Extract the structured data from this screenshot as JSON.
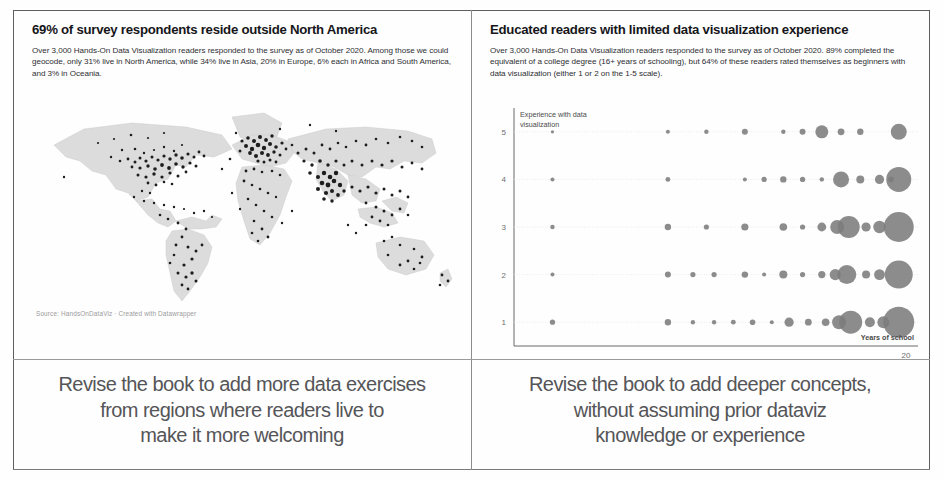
{
  "left_panel": {
    "title": "69% of survey respondents reside outside North America",
    "subtitle": "Over 3,000 Hands-On Data Visualization readers responded to the survey as of October 2020. Among those we could geocode, only 31% live in North America, while 34% live in Asia, 20% in Europe, 6% each in Africa and South America, and 3% in Oceania.",
    "source": "Source: HandsOnDataViz · Created with Datawrapper",
    "caption_lines": [
      "Revise the book to add more data exercises",
      "from regions where readers live to",
      "make it more welcoming"
    ]
  },
  "right_panel": {
    "title": "Educated readers with limited data visualization experience",
    "subtitle": "Over 3,000 Hands-On Data Visualization readers responded to the survey as of October 2020. 89% completed the equivalent of a college degree (16+ years of schooling), but 64% of these readers rated themselves as beginners with data visualization (either 1 or 2 on the 1-5 scale).",
    "caption_lines": [
      "Revise the book to add deeper concepts,",
      "without assuming prior dataviz",
      "knowledge or experience"
    ]
  },
  "colors": {
    "bubble": "#7c7c7c",
    "map_land": "#dcdcdc",
    "map_dot": "#1d1d1d",
    "text": "#1a1a1a",
    "caption": "#555558",
    "gridline": "#e2e2e2"
  },
  "chart_data": [
    {
      "type": "scatter",
      "title": "69% of survey respondents reside outside North America",
      "subtitle": "Over 3,000 Hands-On Data Visualization readers responded to the survey as of October 2020. Among those we could geocode, only 31% live in North America, while 34% live in Asia, 20% in Europe, 6% each in Africa and South America, and 3% in Oceania.",
      "xlabel": "",
      "ylabel": "",
      "legend": [],
      "grid": false,
      "description": "World symbol map of geocoded reader locations plotted as black dots over a light grey land basemap.",
      "regions": [
        {
          "name": "North America",
          "share_pct": 31
        },
        {
          "name": "Asia",
          "share_pct": 34
        },
        {
          "name": "Europe",
          "share_pct": 20
        },
        {
          "name": "Africa",
          "share_pct": 6
        },
        {
          "name": "South America",
          "share_pct": 6
        },
        {
          "name": "Oceania",
          "share_pct": 3
        }
      ],
      "total_respondents": "3,000+",
      "outside_north_america_pct": 69
    },
    {
      "type": "scatter",
      "title": "Educated readers with limited data visualization experience",
      "subtitle": "Over 3,000 Hands-On Data Visualization readers responded to the survey as of October 2020. 89% completed the equivalent of a college degree (16+ years of schooling), but 64% of these readers rated themselves as beginners with data visualization (either 1 or 2 on the 1-5 scale).",
      "xlabel": "Years of school",
      "ylabel": "Experience with data visualization",
      "grid": true,
      "legend": [],
      "xlim": [
        0,
        21
      ],
      "ylim": [
        0.5,
        5.5
      ],
      "xticks": [
        "20"
      ],
      "yticks": [
        "1",
        "2",
        "3",
        "4",
        "5"
      ],
      "annotations": [
        {
          "text": "Experience with data visualization",
          "position": "top-left-axis"
        },
        {
          "text": "Years of school",
          "position": "bottom-right-axis"
        }
      ],
      "size_encoding": "bubble area = number of respondents",
      "points": [
        {
          "x": 2,
          "y": 5,
          "r": 1.6
        },
        {
          "x": 8,
          "y": 5,
          "r": 2.0
        },
        {
          "x": 10,
          "y": 5,
          "r": 2.2
        },
        {
          "x": 12,
          "y": 5,
          "r": 3.0
        },
        {
          "x": 14,
          "y": 5,
          "r": 2.2
        },
        {
          "x": 15,
          "y": 5,
          "r": 3.0
        },
        {
          "x": 16,
          "y": 5,
          "r": 6.5
        },
        {
          "x": 17,
          "y": 5,
          "r": 3.4
        },
        {
          "x": 18,
          "y": 5,
          "r": 3.2
        },
        {
          "x": 20,
          "y": 5,
          "r": 8.0
        },
        {
          "x": 2,
          "y": 4,
          "r": 2.0
        },
        {
          "x": 8,
          "y": 4,
          "r": 2.4
        },
        {
          "x": 12,
          "y": 4,
          "r": 2.0
        },
        {
          "x": 13,
          "y": 4,
          "r": 2.6
        },
        {
          "x": 14,
          "y": 4,
          "r": 3.2
        },
        {
          "x": 15,
          "y": 4,
          "r": 2.6
        },
        {
          "x": 16,
          "y": 4,
          "r": 2.2
        },
        {
          "x": 17,
          "y": 4,
          "r": 8.0
        },
        {
          "x": 18,
          "y": 4,
          "r": 4.0
        },
        {
          "x": 19,
          "y": 4,
          "r": 4.6
        },
        {
          "x": 19.6,
          "y": 4,
          "r": 2.8
        },
        {
          "x": 20,
          "y": 4,
          "r": 12.5
        },
        {
          "x": 2,
          "y": 3,
          "r": 2.2
        },
        {
          "x": 8,
          "y": 3,
          "r": 3.2
        },
        {
          "x": 10,
          "y": 3,
          "r": 2.6
        },
        {
          "x": 12,
          "y": 3,
          "r": 3.6
        },
        {
          "x": 14,
          "y": 3,
          "r": 3.8
        },
        {
          "x": 15,
          "y": 3,
          "r": 2.6
        },
        {
          "x": 16,
          "y": 3,
          "r": 4.4
        },
        {
          "x": 16.8,
          "y": 3,
          "r": 7.0
        },
        {
          "x": 17.4,
          "y": 3,
          "r": 11.0
        },
        {
          "x": 18.3,
          "y": 3,
          "r": 4.6
        },
        {
          "x": 19,
          "y": 3,
          "r": 6.2
        },
        {
          "x": 20,
          "y": 3,
          "r": 15.0
        },
        {
          "x": 2,
          "y": 2,
          "r": 2.0
        },
        {
          "x": 8,
          "y": 2,
          "r": 3.0
        },
        {
          "x": 9.3,
          "y": 2,
          "r": 2.6
        },
        {
          "x": 10.4,
          "y": 2,
          "r": 2.6
        },
        {
          "x": 12,
          "y": 2,
          "r": 3.2
        },
        {
          "x": 13,
          "y": 2,
          "r": 2.0
        },
        {
          "x": 14,
          "y": 2,
          "r": 4.0
        },
        {
          "x": 15,
          "y": 2,
          "r": 2.6
        },
        {
          "x": 16,
          "y": 2,
          "r": 3.6
        },
        {
          "x": 16.7,
          "y": 2,
          "r": 5.6
        },
        {
          "x": 17.3,
          "y": 2,
          "r": 9.5
        },
        {
          "x": 18.3,
          "y": 2,
          "r": 4.0
        },
        {
          "x": 19,
          "y": 2,
          "r": 5.4
        },
        {
          "x": 20,
          "y": 2,
          "r": 14.0
        },
        {
          "x": 2,
          "y": 1,
          "r": 2.6
        },
        {
          "x": 8,
          "y": 1,
          "r": 3.2
        },
        {
          "x": 9.3,
          "y": 1,
          "r": 2.2
        },
        {
          "x": 10.4,
          "y": 1,
          "r": 2.2
        },
        {
          "x": 11.4,
          "y": 1,
          "r": 2.4
        },
        {
          "x": 12.4,
          "y": 1,
          "r": 2.8
        },
        {
          "x": 13.4,
          "y": 1,
          "r": 2.0
        },
        {
          "x": 14.3,
          "y": 1,
          "r": 4.6
        },
        {
          "x": 15.3,
          "y": 1,
          "r": 3.4
        },
        {
          "x": 16.2,
          "y": 1,
          "r": 3.8
        },
        {
          "x": 16.9,
          "y": 1,
          "r": 7.0
        },
        {
          "x": 17.5,
          "y": 1,
          "r": 11.5
        },
        {
          "x": 18.5,
          "y": 1,
          "r": 5.0
        },
        {
          "x": 19.2,
          "y": 1,
          "r": 6.0
        },
        {
          "x": 20,
          "y": 1,
          "r": 15.5
        }
      ]
    }
  ]
}
